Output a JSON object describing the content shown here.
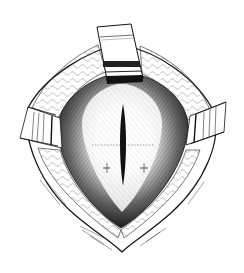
{
  "figure": {
    "type": "line-illustration",
    "colors": {
      "background": "#ffffff",
      "ink": "#111111",
      "shadow": "#1a1a1a",
      "tissue-light": "#f4f4f4"
    },
    "elements": [
      {
        "name": "top-retractor",
        "count": 1
      },
      {
        "name": "side-retractors",
        "count": 2
      },
      {
        "name": "central-incision",
        "count": 1
      },
      {
        "name": "wound-cavity",
        "count": 1
      }
    ]
  }
}
